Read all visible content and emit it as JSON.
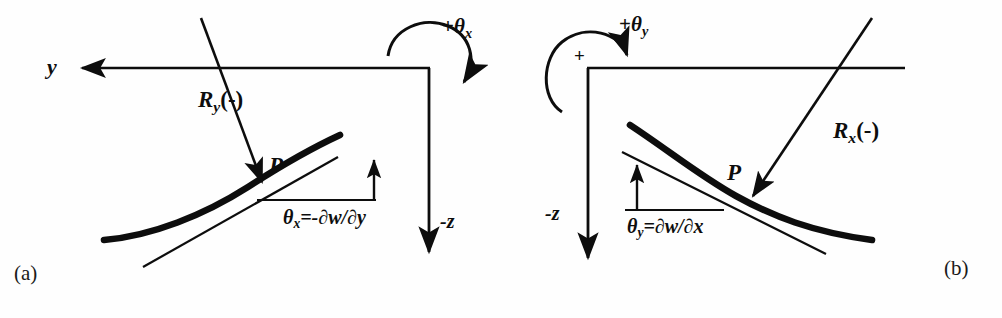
{
  "figure": {
    "background_color": "#fefefe",
    "ink_color": "#0d0d0d",
    "width": 1002,
    "height": 318
  },
  "panels": [
    {
      "id": "a",
      "tag": "(a)",
      "axis_y_label": "y",
      "axis_z_label": "-z",
      "point_label": "P",
      "reaction_label_base": "R",
      "reaction_label_sub": "y",
      "reaction_label_tail": "(-)",
      "rotation_label_sign": "+",
      "rotation_label_base": "θ",
      "rotation_label_sub": "x",
      "angle_label_base": "θ",
      "angle_label_sub": "x",
      "angle_label_expr": "=-∂w/∂y",
      "arc_plus_marker": ""
    },
    {
      "id": "b",
      "tag": "(b)",
      "axis_y_label": "",
      "axis_z_label": "-z",
      "point_label": "P",
      "reaction_label_base": "R",
      "reaction_label_sub": "x",
      "reaction_label_tail": "(-)",
      "rotation_label_sign": "+",
      "rotation_label_base": "θ",
      "rotation_label_sub": "y",
      "angle_label_base": "θ",
      "angle_label_sub": "y",
      "angle_label_expr": "=∂w/∂x",
      "arc_plus_marker": "+"
    }
  ]
}
